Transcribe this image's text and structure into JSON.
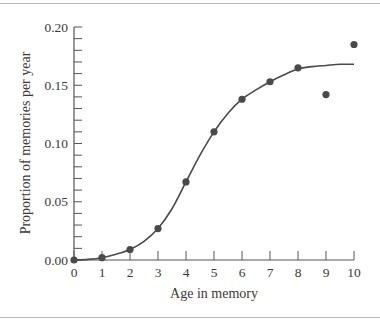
{
  "chart_data": {
    "type": "scatter",
    "title": "",
    "xlabel": "Age in memory",
    "ylabel": "Proportion of memories per year",
    "xlim": [
      0,
      10
    ],
    "ylim": [
      0,
      0.2
    ],
    "x_ticks": [
      "0",
      "1",
      "2",
      "3",
      "4",
      "5",
      "6",
      "7",
      "8",
      "9",
      "10"
    ],
    "y_ticks": [
      "0.00",
      "0.05",
      "0.10",
      "0.15",
      "0.20"
    ],
    "grid": false,
    "legend": null,
    "series": [
      {
        "name": "Observed",
        "kind": "points",
        "x": [
          0,
          1,
          2,
          3,
          4,
          5,
          6,
          7,
          8,
          9,
          10
        ],
        "y": [
          0.0,
          0.002,
          0.009,
          0.027,
          0.067,
          0.11,
          0.138,
          0.153,
          0.165,
          0.142,
          0.185
        ]
      },
      {
        "name": "Fitted curve",
        "kind": "line",
        "x": [
          0,
          0.5,
          1,
          1.5,
          2,
          2.5,
          3,
          3.5,
          4,
          4.5,
          5,
          5.5,
          6,
          6.5,
          7,
          7.5,
          8,
          8.5,
          9,
          9.5,
          10
        ],
        "y": [
          0.0,
          0.0005,
          0.002,
          0.005,
          0.009,
          0.016,
          0.027,
          0.044,
          0.067,
          0.09,
          0.11,
          0.126,
          0.138,
          0.146,
          0.153,
          0.159,
          0.164,
          0.166,
          0.167,
          0.168,
          0.168
        ]
      }
    ]
  },
  "colors": {
    "marker": "#4a4a4a",
    "line": "#4a4a4a",
    "axis": "#555555",
    "text": "#3a3a3a"
  }
}
